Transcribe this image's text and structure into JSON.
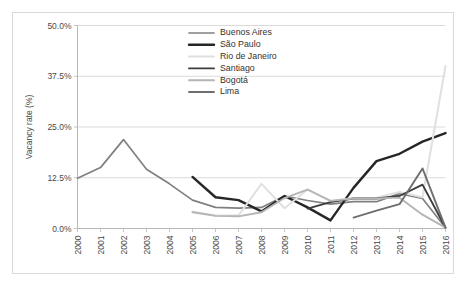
{
  "chart_data": {
    "type": "line",
    "title": "",
    "xlabel": "",
    "ylabel": "Vacancy rate (%)",
    "xlim": [
      2000,
      2016
    ],
    "ylim": [
      0,
      50
    ],
    "yticks": [
      "0.0%",
      "12.5%",
      "25.0%",
      "37.5%",
      "50.0%"
    ],
    "ytick_values": [
      0,
      12.5,
      25,
      37.5,
      50
    ],
    "x": [
      2000,
      2001,
      2002,
      2003,
      2004,
      2005,
      2006,
      2007,
      2008,
      2009,
      2010,
      2011,
      2012,
      2013,
      2014,
      2015,
      2016
    ],
    "categories": [
      "2000",
      "2001",
      "2002",
      "2003",
      "2004",
      "2005",
      "2006",
      "2007",
      "2008",
      "2009",
      "2010",
      "2011",
      "2012",
      "2013",
      "2014",
      "2015",
      "2016"
    ],
    "grid": true,
    "legend_position": "top-center",
    "series": [
      {
        "name": "Buenos Aires",
        "color": "#808080",
        "width": 1.7,
        "values": [
          12.4,
          15.0,
          21.9,
          14.6,
          11.0,
          7.0,
          5.2,
          5.0,
          5.2,
          8.0,
          6.9,
          6.0,
          6.6,
          6.6,
          8.6,
          7.4,
          0.2
        ]
      },
      {
        "name": "São Paulo",
        "color": "#262626",
        "width": 2.4,
        "values": [
          null,
          null,
          null,
          null,
          null,
          12.7,
          7.7,
          7.0,
          4.2,
          8.0,
          5.2,
          2.0,
          10.0,
          16.6,
          18.4,
          21.4,
          23.5
        ]
      },
      {
        "name": "Rio de Janeiro",
        "color": "#e0e0e0",
        "width": 2.0,
        "values": [
          null,
          null,
          null,
          null,
          null,
          4.2,
          3.2,
          3.2,
          11.0,
          5.0,
          9.6,
          6.8,
          7.5,
          7.6,
          9.0,
          7.7,
          40.0
        ]
      },
      {
        "name": "Santiago",
        "color": "#3d3d3d",
        "width": 1.9,
        "values": [
          null,
          null,
          null,
          null,
          null,
          null,
          null,
          null,
          null,
          null,
          4.9,
          6.5,
          7.4,
          7.4,
          8.0,
          10.8,
          0.2
        ]
      },
      {
        "name": "Bogotá",
        "color": "#b5b5b5",
        "width": 1.9,
        "values": [
          null,
          null,
          null,
          null,
          null,
          4.0,
          3.1,
          3.0,
          4.0,
          7.5,
          9.6,
          6.8,
          7.4,
          7.4,
          7.6,
          3.4,
          0.2
        ]
      },
      {
        "name": "Lima",
        "color": "#6e6e6e",
        "width": 1.9,
        "values": [
          null,
          null,
          null,
          null,
          null,
          null,
          null,
          null,
          null,
          null,
          null,
          null,
          2.7,
          4.4,
          6.0,
          14.8,
          0.2
        ]
      }
    ]
  },
  "legend": {
    "entries": [
      {
        "label": "Buenos Aires"
      },
      {
        "label": "São Paulo"
      },
      {
        "label": "Rio de Janeiro"
      },
      {
        "label": "Santiago"
      },
      {
        "label": "Bogotá"
      },
      {
        "label": "Lima"
      }
    ]
  },
  "axes": {
    "y_axis_title": "Vacancy rate (%)"
  }
}
